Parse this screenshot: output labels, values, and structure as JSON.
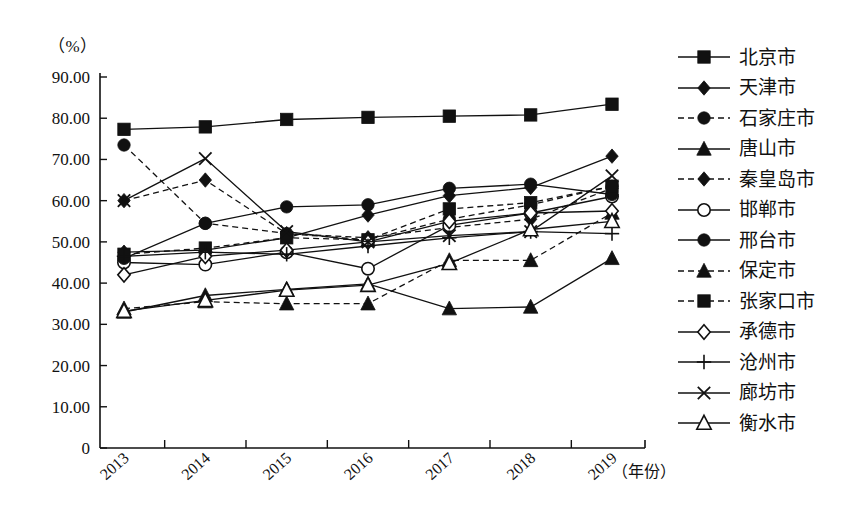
{
  "axis": {
    "y_unit": "（%）",
    "x_title": "（年份）",
    "y_ticks": [
      "90.00",
      "80.00",
      "70.00",
      "60.00",
      "50.00",
      "40.00",
      "30.00",
      "20.00",
      "10.00",
      "0"
    ],
    "x_ticks": [
      "2013",
      "2014",
      "2015",
      "2016",
      "2017",
      "2018",
      "2019"
    ]
  },
  "colors": {
    "ink": "#111111",
    "line": "#222222",
    "background": "#ffffff"
  },
  "legend": {
    "items": [
      {
        "label": "北京市",
        "marker": "square-filled",
        "dash": "solid"
      },
      {
        "label": "天津市",
        "marker": "diamond-filled",
        "dash": "solid"
      },
      {
        "label": "石家庄市",
        "marker": "circle-filled",
        "dash": "dashed"
      },
      {
        "label": "唐山市",
        "marker": "triangle-filled",
        "dash": "solid"
      },
      {
        "label": "秦皇岛市",
        "marker": "diamond-filled",
        "dash": "dashed"
      },
      {
        "label": "邯郸市",
        "marker": "circle-open",
        "dash": "solid"
      },
      {
        "label": "邢台市",
        "marker": "circle-filled",
        "dash": "solid"
      },
      {
        "label": "保定市",
        "marker": "triangle-filled",
        "dash": "dashed"
      },
      {
        "label": "张家口市",
        "marker": "square-filled",
        "dash": "dashed"
      },
      {
        "label": "承德市",
        "marker": "diamond-open",
        "dash": "solid"
      },
      {
        "label": "沧州市",
        "marker": "plus",
        "dash": "solid"
      },
      {
        "label": "廊坊市",
        "marker": "cross",
        "dash": "solid"
      },
      {
        "label": "衡水市",
        "marker": "triangle-open",
        "dash": "solid"
      }
    ]
  },
  "chart_data": {
    "type": "line",
    "title": "",
    "xlabel": "（年份）",
    "ylabel": "（%）",
    "x": [
      "2013",
      "2014",
      "2015",
      "2016",
      "2017",
      "2018",
      "2019"
    ],
    "ylim": [
      0,
      90
    ],
    "ytick_step": 10,
    "grid": false,
    "legend_position": "right",
    "series": [
      {
        "name": "北京市",
        "marker": "square-filled",
        "dash": "solid",
        "values": [
          77.3,
          77.9,
          79.7,
          80.2,
          80.5,
          80.8,
          83.4
        ]
      },
      {
        "name": "天津市",
        "marker": "diamond-filled",
        "dash": "solid",
        "values": [
          47.5,
          48.0,
          51.0,
          56.5,
          61.2,
          63.2,
          70.8
        ]
      },
      {
        "name": "石家庄市",
        "marker": "circle-filled",
        "dash": "dashed",
        "values": [
          73.5,
          54.5,
          52.0,
          50.5,
          55.5,
          59.0,
          63.5
        ]
      },
      {
        "name": "唐山市",
        "marker": "triangle-filled",
        "dash": "solid",
        "values": [
          33.0,
          37.0,
          38.5,
          39.8,
          33.8,
          34.2,
          46.0
        ]
      },
      {
        "name": "秦皇岛市",
        "marker": "diamond-filled",
        "dash": "dashed",
        "values": [
          60.0,
          65.0,
          52.0,
          51.0,
          53.5,
          55.5,
          63.0
        ]
      },
      {
        "name": "邯郸市",
        "marker": "circle-open",
        "dash": "solid",
        "values": [
          45.0,
          44.5,
          47.5,
          43.5,
          54.0,
          57.0,
          61.0
        ]
      },
      {
        "name": "邢台市",
        "marker": "circle-filled",
        "dash": "solid",
        "values": [
          46.0,
          54.5,
          58.5,
          59.0,
          63.0,
          64.0,
          61.5
        ]
      },
      {
        "name": "保定市",
        "marker": "triangle-filled",
        "dash": "dashed",
        "values": [
          33.8,
          35.5,
          35.0,
          35.0,
          45.5,
          45.5,
          57.0
        ]
      },
      {
        "name": "张家口市",
        "marker": "square-filled",
        "dash": "dashed",
        "values": [
          47.0,
          48.5,
          51.0,
          50.5,
          58.0,
          59.5,
          63.5
        ]
      },
      {
        "name": "承德市",
        "marker": "diamond-open",
        "dash": "solid",
        "values": [
          42.0,
          46.5,
          48.0,
          50.0,
          55.0,
          57.0,
          57.5
        ]
      },
      {
        "name": "沧州市",
        "marker": "plus",
        "dash": "solid",
        "values": [
          46.5,
          47.5,
          47.0,
          49.0,
          51.0,
          52.5,
          52.0
        ]
      },
      {
        "name": "廊坊市",
        "marker": "cross",
        "dash": "solid",
        "values": [
          60.0,
          70.2,
          52.5,
          50.0,
          51.5,
          52.5,
          66.0
        ]
      },
      {
        "name": "衡水市",
        "marker": "triangle-open",
        "dash": "solid",
        "values": [
          33.2,
          35.8,
          38.3,
          39.5,
          44.8,
          53.0,
          55.0
        ]
      }
    ]
  }
}
